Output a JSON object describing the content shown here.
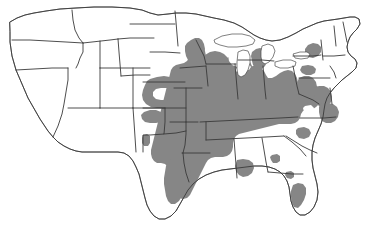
{
  "figure": {
    "type": "distribution-map",
    "region": "Contiguous United States",
    "title": "",
    "caption": "",
    "width_px": 367,
    "height_px": 233,
    "background_color": "#ffffff"
  },
  "legend": {
    "visible": false,
    "entries": [
      {
        "label": "Shaded range",
        "color": "#868686"
      },
      {
        "label": "Outside range",
        "color": "#ffffff"
      }
    ]
  },
  "style": {
    "range_fill": "#868686",
    "unshaded_fill": "#ffffff",
    "state_border": "#4a4a4a",
    "nation_border": "#3a3a3a",
    "border_width": 0.7
  },
  "chart_data": {
    "type": "map",
    "title": "",
    "projection_hint": "albers-usa-approx",
    "shaded_color": "#868686",
    "unshaded_color": "#ffffff",
    "core_shaded_states": [
      "Iowa",
      "Missouri",
      "Illinois",
      "Indiana",
      "Ohio",
      "Kentucky",
      "Tennessee",
      "Arkansas",
      "Mississippi",
      "Alabama",
      "Louisiana"
    ],
    "partially_shaded_states": [
      "Minnesota",
      "Wisconsin",
      "Michigan",
      "Nebraska",
      "Kansas",
      "Oklahoma",
      "Texas",
      "West Virginia",
      "Virginia",
      "Maryland",
      "Delaware",
      "Pennsylvania",
      "New York",
      "North Carolina",
      "South Carolina",
      "Georgia",
      "Florida"
    ],
    "unshaded_states": [
      "Washington",
      "Oregon",
      "California",
      "Idaho",
      "Nevada",
      "Montana",
      "Wyoming",
      "Utah",
      "Arizona",
      "Colorado",
      "New Mexico",
      "North Dakota",
      "South Dakota",
      "Maine",
      "New Hampshire",
      "Vermont",
      "Massachusetts",
      "Connecticut",
      "Rhode Island",
      "New Jersey"
    ]
  }
}
